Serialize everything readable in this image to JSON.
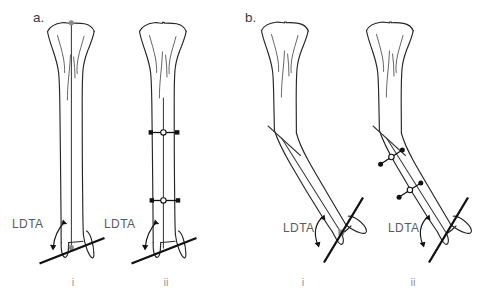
{
  "figure": {
    "background_color": "#ffffff",
    "width": 490,
    "height": 301,
    "colors": {
      "bone_outline": "#262626",
      "bone_detail": "#555555",
      "mechanical_axis": "#3a3a3a",
      "joint_orientation_line": "#111111",
      "angle_arc": "#1a1a1a",
      "osteotomy_marker_fill": "#111111",
      "osteotomy_marker_open": "#ffffff",
      "grey_pivot_marker": "#8a8a8a",
      "label_text": "#5a5a5a",
      "panel_letter_text": "#3b3b3b",
      "roman_numeral_text": "#9a9a9a"
    }
  },
  "panels": [
    {
      "id": "panel-a",
      "letter": "a.",
      "subpanels": [
        {
          "id": "panel-a-i",
          "roman": "i",
          "ldta_label": "LDTA",
          "description": "Straight tibia, anteroposterior view with mechanical axis line and distal joint orientation line",
          "osteotomy_markers": 0,
          "pivot_markers": 2
        },
        {
          "id": "panel-a-ii",
          "roman": "ii",
          "ldta_label": "LDTA",
          "description": "Straight tibia with two transverse osteotomy marker bars on the diaphysis",
          "osteotomy_markers": 2,
          "pivot_markers": 0
        }
      ]
    },
    {
      "id": "panel-b",
      "letter": "b.",
      "subpanels": [
        {
          "id": "panel-b-i",
          "roman": "i",
          "ldta_label": "LDTA",
          "description": "Angulated tibia with oblique distal segment and joint orientation line",
          "osteotomy_markers": 0,
          "pivot_markers": 1
        },
        {
          "id": "panel-b-ii",
          "roman": "ii",
          "ldta_label": "LDTA",
          "description": "Angulated tibia with two oblique osteotomy marker bars along the distal segment",
          "osteotomy_markers": 2,
          "pivot_markers": 0
        }
      ]
    }
  ],
  "annotations": {
    "ldta_full_name": "LDTA",
    "panel_a_letter": "a.",
    "panel_b_letter": "b.",
    "roman_i": "i",
    "roman_ii": "ii"
  }
}
